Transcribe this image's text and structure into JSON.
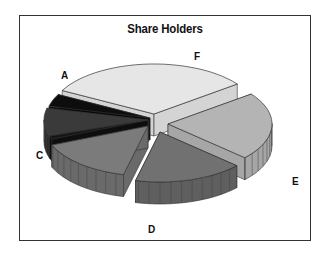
{
  "chart_data": {
    "type": "pie",
    "style": "3d-exploded",
    "title": "Share Holders",
    "categories": [
      "A",
      "B",
      "B2",
      "C",
      "D",
      "E",
      "F"
    ],
    "labels_shown": [
      "A",
      "",
      "",
      "C",
      "D",
      "E",
      "F"
    ],
    "values": [
      4,
      9,
      1,
      15,
      17,
      22,
      32
    ],
    "colors": [
      "#0d0d0d",
      "#3a3a3a",
      "#151515",
      "#7b7b7b",
      "#717171",
      "#b4b4b4",
      "#e6e6e6"
    ],
    "side_colors": [
      "#080808",
      "#2a2a2a",
      "#0e0e0e",
      "#6a6a6a",
      "#5f5f5f",
      "#a6a6a6",
      "#d4d4d4"
    ],
    "unit": "percent (estimated)",
    "legend": "none (direct labels)"
  },
  "labels": {
    "A": "A",
    "C": "C",
    "D": "D",
    "E": "E",
    "F": "F"
  }
}
